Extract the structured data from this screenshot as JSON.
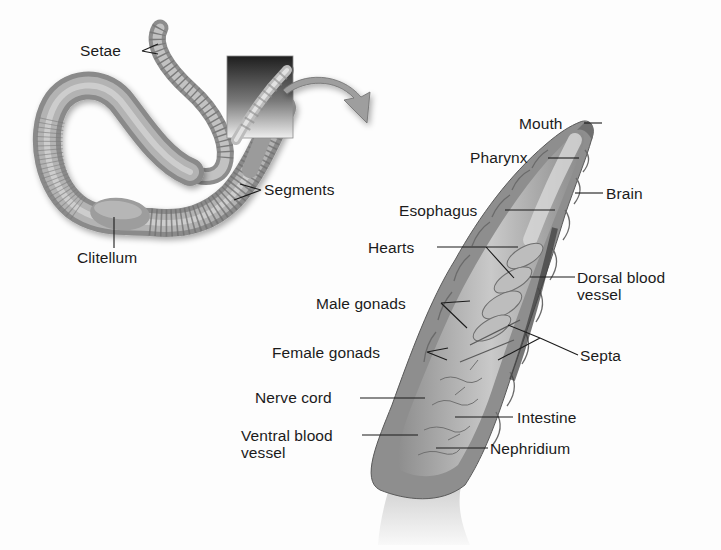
{
  "figure": {
    "overview": {
      "labels": [
        {
          "id": "setae",
          "text": "Setae"
        },
        {
          "id": "segments",
          "text": "Segments"
        },
        {
          "id": "clitellum",
          "text": "Clitellum"
        }
      ]
    },
    "detail": {
      "labels": [
        {
          "id": "mouth",
          "text": "Mouth"
        },
        {
          "id": "pharynx",
          "text": "Pharynx"
        },
        {
          "id": "brain",
          "text": "Brain"
        },
        {
          "id": "esophagus",
          "text": "Esophagus"
        },
        {
          "id": "hearts",
          "text": "Hearts"
        },
        {
          "id": "dorsal-blood-vessel",
          "text": "Dorsal blood\nvessel"
        },
        {
          "id": "male-gonads",
          "text": "Male gonads"
        },
        {
          "id": "female-gonads",
          "text": "Female gonads"
        },
        {
          "id": "septa",
          "text": "Septa"
        },
        {
          "id": "nerve-cord",
          "text": "Nerve cord"
        },
        {
          "id": "intestine",
          "text": "Intestine"
        },
        {
          "id": "ventral-blood-vessel",
          "text": "Ventral blood\nvessel"
        },
        {
          "id": "nephridium",
          "text": "Nephridium"
        }
      ]
    },
    "colors": {
      "worm_body": "#a9a9a9",
      "worm_dark": "#6e6e6e",
      "worm_light": "#d4d4d4",
      "inset_box_top": "#222222",
      "inset_box_bottom": "#e6e6e6",
      "arrow_fill": "#9a9a9a",
      "leader_line": "#1b1b1b",
      "text": "#1b1b1b"
    }
  }
}
